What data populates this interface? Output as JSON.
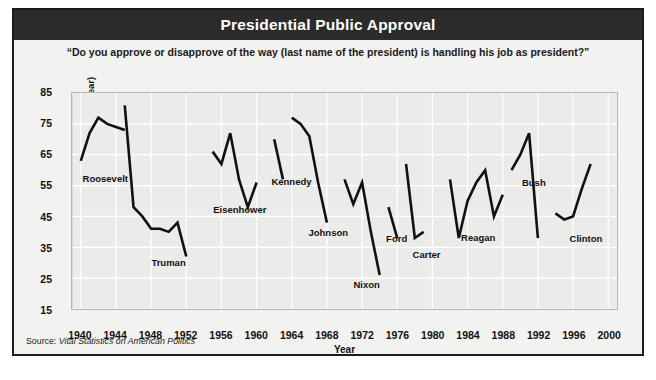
{
  "figure": {
    "title": "Presidential Public Approval",
    "subtitle": "“Do you approve or disapprove of the way (last name of the president) is handling his job as president?”",
    "source_prefix": "Source: ",
    "source_text": "Vital Statistics on American Politics",
    "colors": {
      "title_bar": "#2b2b2b",
      "title_text": "#ffffff",
      "plot_background": "#ebebe9",
      "figure_background": "#f2f2f0",
      "line": "#111111",
      "grid": "#ffffff",
      "border": "#1c1c1c"
    }
  },
  "chart_data": {
    "type": "line",
    "title": "Presidential Public Approval",
    "subtitle": "“Do you approve or disapprove of the way (last name of the president) is handling his job as president?”",
    "xlabel": "Year",
    "ylabel": "Percent (averaged by year)",
    "xlim": [
      1939,
      2001
    ],
    "ylim": [
      15,
      85
    ],
    "xticks": [
      1940,
      1944,
      1948,
      1952,
      1956,
      1960,
      1964,
      1968,
      1972,
      1976,
      1980,
      1984,
      1988,
      1992,
      1996,
      2000
    ],
    "yticks": [
      15,
      25,
      35,
      45,
      55,
      65,
      75,
      85
    ],
    "grid": true,
    "legend": "none",
    "annotations": [
      {
        "text": "Roosevelt",
        "x": 1940.2,
        "y": 57.5
      },
      {
        "text": "Truman",
        "x": 1948.0,
        "y": 30.5
      },
      {
        "text": "Eisenhower",
        "x": 1955.0,
        "y": 47.5
      },
      {
        "text": "Kennedy",
        "x": 1961.6,
        "y": 56.5
      },
      {
        "text": "Johnson",
        "x": 1965.8,
        "y": 40.0
      },
      {
        "text": "Nixon",
        "x": 1970.9,
        "y": 23.5
      },
      {
        "text": "Ford",
        "x": 1974.6,
        "y": 38.0
      },
      {
        "text": "Carter",
        "x": 1977.6,
        "y": 33.0
      },
      {
        "text": "Reagan",
        "x": 1983.1,
        "y": 38.5
      },
      {
        "text": "Bush",
        "x": 1990.0,
        "y": 56.0
      },
      {
        "text": "Clinton",
        "x": 1995.4,
        "y": 38.0
      }
    ],
    "series": [
      {
        "name": "Roosevelt",
        "x": [
          1940,
          1941,
          1942,
          1943,
          1944,
          1945
        ],
        "values": [
          63,
          72,
          77,
          75,
          74,
          73
        ]
      },
      {
        "name": "Truman",
        "x": [
          1945,
          1946,
          1947,
          1948,
          1949,
          1950,
          1951,
          1952
        ],
        "values": [
          81,
          48,
          45,
          41,
          41,
          40,
          43,
          32
        ]
      },
      {
        "name": "Eisenhower",
        "x": [
          1955,
          1956,
          1957,
          1958,
          1959,
          1960
        ],
        "values": [
          66,
          62,
          72,
          57,
          48,
          56
        ]
      },
      {
        "name": "Kennedy",
        "x": [
          1962,
          1963
        ],
        "values": [
          70,
          57
        ]
      },
      {
        "name": "Johnson",
        "x": [
          1964,
          1965,
          1966,
          1967,
          1968
        ],
        "values": [
          77,
          75,
          71,
          56,
          43
        ]
      },
      {
        "name": "Nixon",
        "x": [
          1970,
          1971,
          1972,
          1973,
          1974
        ],
        "values": [
          57,
          49,
          56,
          40,
          26
        ]
      },
      {
        "name": "Ford",
        "x": [
          1975,
          1976
        ],
        "values": [
          48,
          38
        ]
      },
      {
        "name": "Carter",
        "x": [
          1977,
          1978,
          1979
        ],
        "values": [
          62,
          38,
          40
        ]
      },
      {
        "name": "Reagan",
        "x": [
          1982,
          1983,
          1984,
          1985,
          1986,
          1987,
          1988
        ],
        "values": [
          57,
          38,
          50,
          56,
          60,
          45,
          52
        ]
      },
      {
        "name": "Bush",
        "x": [
          1989,
          1990,
          1991,
          1992
        ],
        "values": [
          60,
          65,
          72,
          38
        ]
      },
      {
        "name": "Clinton",
        "x": [
          1994,
          1995,
          1996,
          1997,
          1998
        ],
        "values": [
          46,
          44,
          45,
          54,
          62
        ]
      }
    ]
  }
}
